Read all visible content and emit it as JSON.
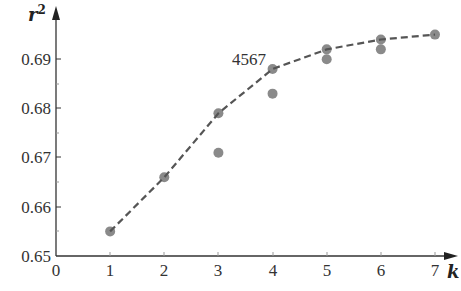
{
  "chart_data": {
    "type": "scatter",
    "title": "",
    "xlabel": "k",
    "ylabel": "r²",
    "xlim": [
      0,
      7.4
    ],
    "ylim": [
      0.65,
      0.697
    ],
    "x_ticks": [
      "0",
      "1",
      "2",
      "3",
      "4",
      "5",
      "6",
      "7"
    ],
    "y_ticks": [
      "0.65",
      "0.66",
      "0.67",
      "0.68",
      "0.69"
    ],
    "grid": false,
    "legend": null,
    "annotations": [
      {
        "text": "4567",
        "x": 3.55,
        "y": 0.6898
      }
    ],
    "series": [
      {
        "name": "best r² (dashed line)",
        "style": "dashed-line-with-markers",
        "x": [
          1,
          2,
          3,
          4,
          5,
          6,
          7
        ],
        "values": [
          0.655,
          0.666,
          0.679,
          0.688,
          0.692,
          0.694,
          0.695
        ]
      },
      {
        "name": "other subsets",
        "style": "markers",
        "x": [
          3,
          4,
          5,
          6
        ],
        "values": [
          0.671,
          0.683,
          0.69,
          0.692
        ]
      }
    ]
  },
  "labels": {
    "ylabel": "r",
    "ylabel_sup": "2",
    "xlabel": "k",
    "annotation": "4567",
    "xticks": [
      "0",
      "1",
      "2",
      "3",
      "4",
      "5",
      "6",
      "7"
    ],
    "yticks": [
      "0.65",
      "0.66",
      "0.67",
      "0.68",
      "0.69"
    ]
  },
  "colors": {
    "axis": "#333333",
    "line": "#555555",
    "marker": "#8a8a8a"
  }
}
